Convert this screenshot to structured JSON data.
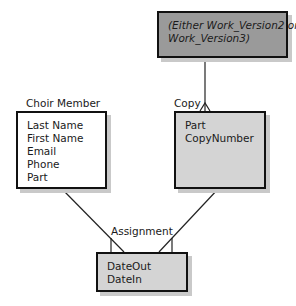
{
  "diagram": {
    "entities": {
      "work_version": {
        "label": "",
        "attributes": [
          "(Either Work_Version2 or",
          "Work_Version3)"
        ],
        "fill": "#9a9a9a"
      },
      "choir_member": {
        "label": "Choir Member",
        "attributes": [
          "Last Name",
          "First Name",
          "Email",
          "Phone",
          "Part"
        ],
        "fill": "#ffffff"
      },
      "copy": {
        "label": "Copy",
        "attributes": [
          "Part",
          "CopyNumber"
        ],
        "fill": "#d4d4d4"
      },
      "assignment": {
        "label": "Assignment",
        "attributes": [
          "DateOut",
          "DateIn"
        ],
        "fill": "#d4d4d4"
      }
    },
    "relationships": [
      {
        "from": "work_version",
        "to": "copy",
        "type": "one-to-many"
      },
      {
        "from": "choir_member",
        "to": "assignment",
        "type": "one-to-many"
      },
      {
        "from": "copy",
        "to": "assignment",
        "type": "one-to-many"
      }
    ]
  }
}
